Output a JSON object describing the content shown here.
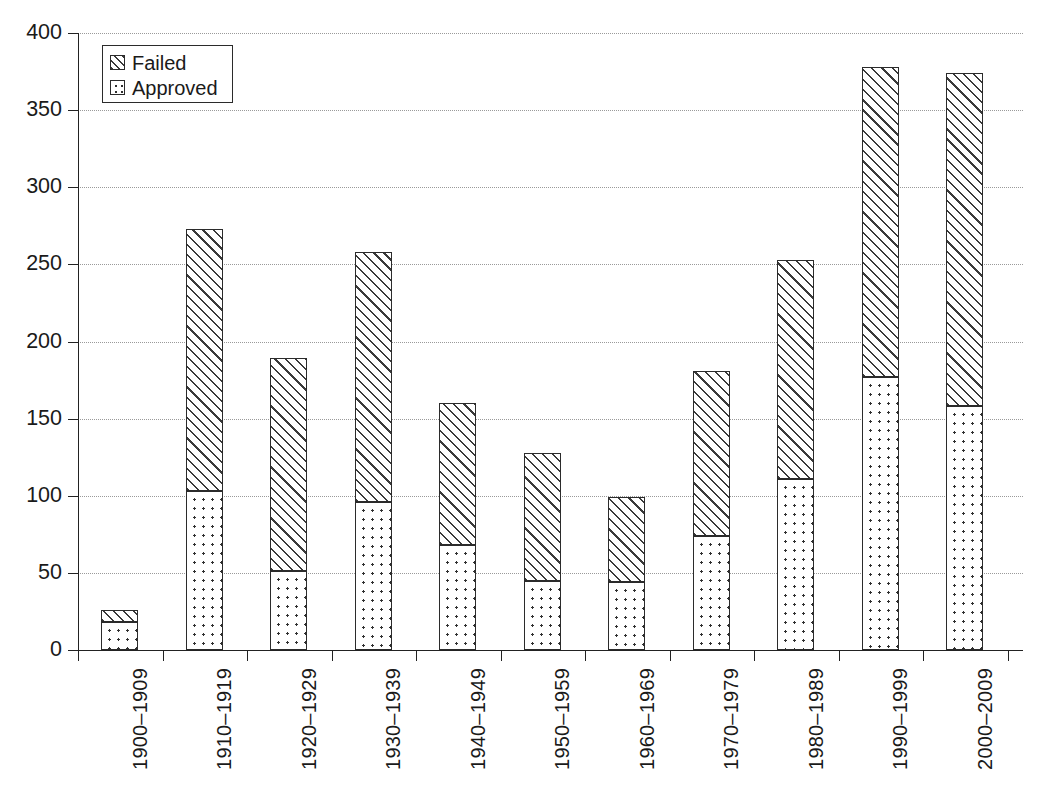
{
  "chart_data": {
    "type": "bar",
    "subtype": "stacked-bar-vertical",
    "title": "",
    "xlabel": "",
    "ylabel": "",
    "ylim": [
      0,
      400
    ],
    "yticks": [
      0,
      50,
      100,
      150,
      200,
      250,
      300,
      350,
      400
    ],
    "ytick_labels": [
      "0",
      "50",
      "100",
      "150",
      "200",
      "250",
      "300",
      "350",
      "400"
    ],
    "grid": "horizontal-dotted",
    "legend_position": "top-left-inside",
    "categories": [
      "1900–1909",
      "1910–1919",
      "1920–1929",
      "1930–1939",
      "1940–1949",
      "1950–1959",
      "1960–1969",
      "1970–1979",
      "1980–1989",
      "1990–1999",
      "2000–2009"
    ],
    "series": [
      {
        "name": "Approved",
        "pattern": "dotted",
        "stack_position": "bottom",
        "values": [
          18,
          103,
          51,
          96,
          68,
          45,
          44,
          74,
          111,
          177,
          158
        ]
      },
      {
        "name": "Failed",
        "pattern": "diagonal-hatch",
        "stack_position": "top",
        "values": [
          8,
          170,
          138,
          162,
          92,
          83,
          55,
          107,
          142,
          201,
          216
        ]
      }
    ],
    "totals": [
      26,
      273,
      189,
      258,
      160,
      128,
      99,
      181,
      253,
      378,
      374
    ]
  },
  "legend": {
    "items": [
      {
        "label": "Failed",
        "swatch": "hatch-swatch-icon"
      },
      {
        "label": "Approved",
        "swatch": "dot-swatch-icon"
      }
    ]
  },
  "colors": {
    "axis": "#222222",
    "gridline": "#9a9a9a",
    "ink": "#1a1a1a",
    "background": "#ffffff"
  }
}
